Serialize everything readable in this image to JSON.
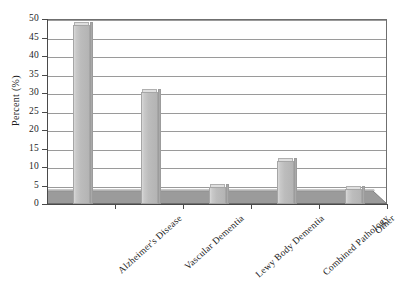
{
  "chart_data": {
    "type": "bar",
    "title": "",
    "subtitle": "",
    "xlabel": "",
    "ylabel": "Percent (%)",
    "categories": [
      "Alzheimer's Disease",
      "Vascular Dementia",
      "Lewy Body Dementia",
      "Combined Pathology",
      "Other"
    ],
    "values": [
      48.5,
      30.2,
      4.5,
      11.5,
      4.0
    ],
    "ylim": [
      0,
      50
    ],
    "ytick_step": 5,
    "yticks": [
      "50",
      "45",
      "40",
      "35",
      "30",
      "25",
      "20",
      "15",
      "10",
      "5",
      "0"
    ],
    "grid": true,
    "grid_axis": "y",
    "legend": false,
    "legend_position": "none",
    "style": "3d-column",
    "annotations": []
  },
  "colors": {
    "bar_face": "#bcbcbc",
    "bar_highlight": "#d8d8d8",
    "bar_top": "#dfdfdf",
    "bar_side": "#a9a9a9",
    "bar_outline": "#a6a6a6",
    "floor_fill": "#9b9b9b",
    "floor_top": "#c9c9c9",
    "gridline": "#9a9a9a",
    "axis": "#4a4a4a",
    "frame": "#6f6f6f",
    "text": "#1d1d1d",
    "background": "#ffffff"
  }
}
